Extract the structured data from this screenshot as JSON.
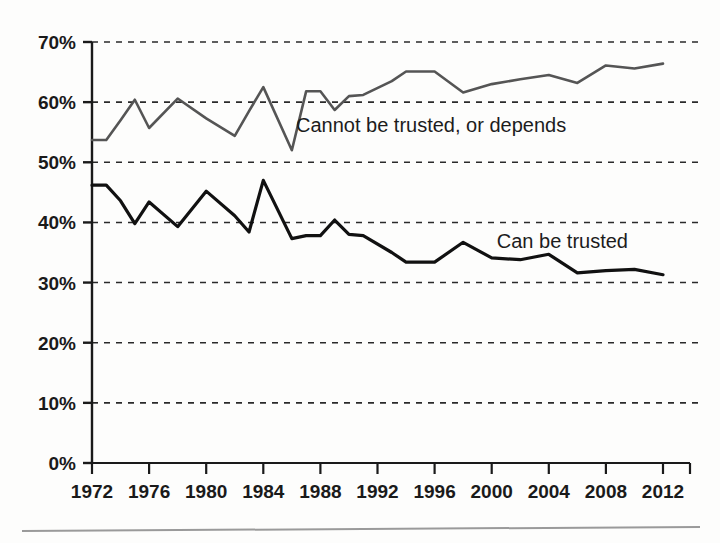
{
  "chart_data": {
    "type": "line",
    "title": "",
    "subtitle": "",
    "xlabel": "",
    "ylabel": "",
    "xlim": [
      1972,
      2012
    ],
    "ylim": [
      0,
      70
    ],
    "grid": true,
    "grid_style": "horizontal-dashed",
    "legend_position": "inline-annotations",
    "y_ticks": [
      "0%",
      "10%",
      "20%",
      "30%",
      "40%",
      "50%",
      "60%",
      "70%"
    ],
    "y_tick_values": [
      0,
      10,
      20,
      30,
      40,
      50,
      60,
      70
    ],
    "x_ticks": [
      "1972",
      "1976",
      "1980",
      "1984",
      "1988",
      "1992",
      "1996",
      "2000",
      "2004",
      "2008",
      "2012"
    ],
    "x_tick_values": [
      1972,
      1976,
      1980,
      1984,
      1988,
      1992,
      1996,
      2000,
      2004,
      2008,
      2012
    ],
    "x": [
      1972,
      1973,
      1974,
      1975,
      1976,
      1978,
      1980,
      1982,
      1983,
      1984,
      1986,
      1987,
      1988,
      1989,
      1990,
      1991,
      1993,
      1994,
      1996,
      1998,
      2000,
      2002,
      2004,
      2006,
      2008,
      2010,
      2012
    ],
    "series": [
      {
        "name": "Cannot be trusted, or depends",
        "color": "#555555",
        "line_width": 2.6,
        "label_text": "Cannot be trusted, or depends",
        "values": [
          53.7,
          53.7,
          57.0,
          60.4,
          55.7,
          60.6,
          57.3,
          54.4,
          58.5,
          62.5,
          52.0,
          61.8,
          61.8,
          58.7,
          61.0,
          61.2,
          63.5,
          65.1,
          65.1,
          61.6,
          63.0,
          63.8,
          64.5,
          63.2,
          66.1,
          65.6,
          66.4
        ]
      },
      {
        "name": "Can be trusted",
        "color": "#111111",
        "line_width": 3.2,
        "label_text": "Can be trusted",
        "values": [
          46.2,
          46.2,
          43.6,
          39.8,
          43.4,
          39.3,
          45.2,
          41.1,
          38.4,
          47.0,
          37.3,
          37.8,
          37.8,
          40.4,
          38.0,
          37.8,
          35.0,
          33.4,
          33.4,
          36.7,
          34.1,
          33.8,
          34.7,
          31.6,
          32.0,
          32.2,
          31.3
        ]
      }
    ],
    "annotations": [
      {
        "text": "Cannot be trusted, or depends",
        "x_px": 296,
        "y_px": 132,
        "anchor": "start"
      },
      {
        "text": "Can be trusted",
        "x_px": 628,
        "y_px": 248,
        "anchor": "end"
      }
    ]
  },
  "figure": {
    "background": "#fdfdfc",
    "axis_color": "#1a1a1a",
    "grid_color": "#2a2a2a",
    "rule_color": "#9a9a9a"
  }
}
